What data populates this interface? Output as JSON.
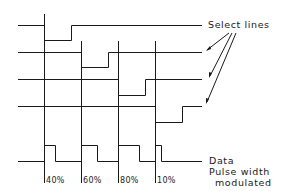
{
  "labels": {
    "select_lines": "Select lines",
    "data_line1": "Data",
    "data_line2": "Pulse width",
    "data_line3": "modulated"
  },
  "percentages": [
    "40%",
    "60%",
    "80%",
    "10%"
  ],
  "colors": {
    "stroke": "#1a1a1a",
    "background": "#ffffff"
  },
  "timing": {
    "slot_boundaries_x": [
      44,
      81,
      118,
      155
    ],
    "select_lines": [
      {
        "name": "select-line-1",
        "low_slot": 1
      },
      {
        "name": "select-line-2",
        "low_slot": 2
      },
      {
        "name": "select-line-3",
        "low_slot": 3
      },
      {
        "name": "select-line-4",
        "low_slot": 4
      }
    ],
    "pulse_duty_cycles": [
      40,
      60,
      80,
      10
    ]
  }
}
